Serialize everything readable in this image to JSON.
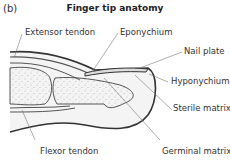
{
  "panel_label": "(b)",
  "title": "Finger tip anatomy",
  "labels": {
    "extensor_tendon": "Extensor tendon",
    "eponychium": "Eponychium",
    "nail_plate": "Nail plate",
    "hyponychium": "Hyponychium",
    "sterile_matrix": "Sterile matrix",
    "flexor_tendon": "Flexor tendon",
    "germinal_matrix": "Germinal matrix"
  },
  "colors": {
    "outline": "#333333",
    "fill": "#f2f2f2",
    "bone_stipple": "#bbbbbb",
    "leader": "#666666"
  }
}
